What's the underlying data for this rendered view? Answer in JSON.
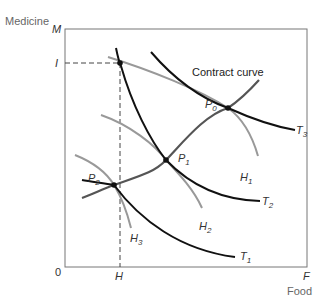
{
  "diagram": {
    "type": "edgeworth-box-production",
    "y_axis": {
      "label": "Medicine",
      "symbol": "M",
      "tick": "I"
    },
    "x_axis": {
      "label": "Food",
      "symbol": "F",
      "tick": "H"
    },
    "origin": "0",
    "contract_curve_label": "Contract curve",
    "points": [
      {
        "name": "P",
        "sub": "0"
      },
      {
        "name": "P",
        "sub": "1"
      },
      {
        "name": "P",
        "sub": "2"
      }
    ],
    "isoquants_T": [
      {
        "name": "T",
        "sub": "1"
      },
      {
        "name": "T",
        "sub": "2"
      },
      {
        "name": "T",
        "sub": "3"
      }
    ],
    "isoquants_H": [
      {
        "name": "H",
        "sub": "1"
      },
      {
        "name": "H",
        "sub": "2"
      },
      {
        "name": "H",
        "sub": "3"
      }
    ],
    "colors": {
      "frame": "#777777",
      "t_curves": "#111111",
      "h_curves": "#999999",
      "contract_curve": "#555555",
      "dashed": "#444444"
    }
  }
}
